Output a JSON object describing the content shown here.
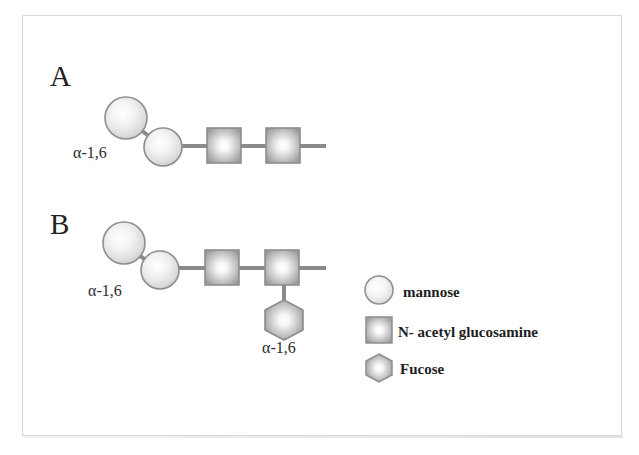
{
  "figure": {
    "panels": [
      {
        "id": "A",
        "letter": "A",
        "description": "Core glycan: two mannose residues linked to two N-acetyl glucosamine residues",
        "linkage_label": "α-1,6",
        "residues": [
          {
            "type": "mannose",
            "shape": "circle",
            "index": 1
          },
          {
            "type": "mannose",
            "shape": "circle",
            "index": 2
          },
          {
            "type": "N-acetyl glucosamine",
            "shape": "square",
            "index": 3
          },
          {
            "type": "N-acetyl glucosamine",
            "shape": "square",
            "index": 4
          }
        ]
      },
      {
        "id": "B",
        "letter": "B",
        "description": "Core fucosylated glycan: two mannose, two N-acetyl glucosamine, plus fucose branch",
        "linkage_label": "α-1,6",
        "branch_linkage_label": "α-1,6",
        "residues": [
          {
            "type": "mannose",
            "shape": "circle",
            "index": 1
          },
          {
            "type": "mannose",
            "shape": "circle",
            "index": 2
          },
          {
            "type": "N-acetyl glucosamine",
            "shape": "square",
            "index": 3
          },
          {
            "type": "N-acetyl glucosamine",
            "shape": "square",
            "index": 4
          },
          {
            "type": "Fucose",
            "shape": "hexagon",
            "index": 5,
            "attached_to": 4,
            "position": "below"
          }
        ]
      }
    ],
    "legend": {
      "items": [
        {
          "symbol": "circle",
          "icon_name": "mannose-circle-icon",
          "label": "mannose"
        },
        {
          "symbol": "square",
          "icon_name": "glcnac-square-icon",
          "label": "N- acetyl glucosamine"
        },
        {
          "symbol": "hexagon",
          "icon_name": "fucose-hexagon-icon",
          "label": "Fucose"
        }
      ]
    },
    "colors": {
      "shape_edge": "#8c8c8c",
      "shape_fill_center": "#ffffff",
      "shape_fill_edge": "#9a9a9a",
      "bond_line": "#8a8a8a",
      "text": "#222222",
      "frame_border": "#d8d8d8",
      "background": "#ffffff"
    }
  }
}
